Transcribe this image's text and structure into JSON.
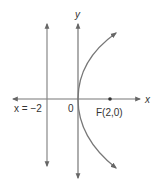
{
  "diagram": {
    "labels": {
      "x_axis": "x",
      "y_axis": "y",
      "origin": "0",
      "directrix": "x = −2",
      "focus": "F(2,0)"
    },
    "elements": {
      "directrix_x": -2,
      "focus": [
        2,
        0
      ],
      "vertex": [
        0,
        0
      ],
      "curve": "parabola opening right"
    },
    "colors": {
      "line": "#777777",
      "text": "#333333"
    }
  }
}
